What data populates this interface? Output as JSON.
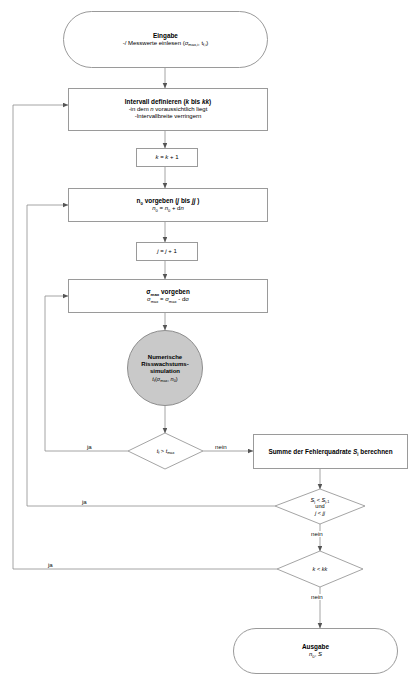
{
  "diagram": {
    "type": "flowchart",
    "language": "de",
    "nodes": [
      {
        "id": "eingabe",
        "shape": "terminator",
        "heading": "Eingabe",
        "lines": [
          "-/ Messwerte einlesen (σmax,i , tf,i)"
        ]
      },
      {
        "id": "intervall",
        "shape": "process",
        "heading": "Intervall definieren (k bis kk)",
        "lines": [
          "-in dem n voraussichtlich liegt",
          "-Intervallbreite verringern"
        ]
      },
      {
        "id": "k-inc",
        "shape": "process",
        "heading": "",
        "lines": [
          "k = k + 1"
        ]
      },
      {
        "id": "n0-vorgeben",
        "shape": "process",
        "heading": "n0 vorgeben (j bis jj )",
        "lines": [
          "n0 = n0 + dn"
        ]
      },
      {
        "id": "j-inc",
        "shape": "process",
        "heading": "",
        "lines": [
          "j = j + 1"
        ]
      },
      {
        "id": "sigma-vorgeben",
        "shape": "process",
        "heading": "σmax vorgeben",
        "lines": [
          "σmax = σmax - dσ"
        ]
      },
      {
        "id": "simulation",
        "shape": "ellipse",
        "heading": "Numerische Risswachstums- simulation",
        "lines": [
          "tf(σmax, n0)"
        ]
      },
      {
        "id": "decision-tf",
        "shape": "decision",
        "heading": "",
        "lines": [
          "tf > tmax"
        ]
      },
      {
        "id": "summe",
        "shape": "process",
        "heading": "Summe der Fehlerquadrate Sj berechnen",
        "lines": []
      },
      {
        "id": "decision-sj",
        "shape": "decision",
        "heading": "",
        "lines": [
          "Sj < Sj-1",
          "und",
          "j < jj"
        ]
      },
      {
        "id": "decision-k",
        "shape": "decision",
        "heading": "",
        "lines": [
          "k < kk"
        ]
      },
      {
        "id": "ausgabe",
        "shape": "terminator",
        "heading": "Ausgabe",
        "lines": [
          "n0, S"
        ]
      }
    ],
    "labels": {
      "eingabe_heading": "Eingabe",
      "eingabe_line1_pre": "-/ Messwerte einlesen (",
      "eingabe_line1_sig": "σ",
      "eingabe_line1_sigsub": "max,i",
      "eingabe_line1_mid": ", t",
      "eingabe_line1_tsub": "f,i",
      "eingabe_line1_post": ")",
      "intervall_heading_pre": "Intervall definieren (",
      "intervall_heading_k": "k",
      "intervall_heading_bis": " bis ",
      "intervall_heading_kk": "kk",
      "intervall_heading_post": ")",
      "intervall_line2": "-in dem ",
      "intervall_line2_n": "n",
      "intervall_line2_post": " voraussichtlich liegt",
      "intervall_line3": "-Intervallbreite verringern",
      "kinc_text_k1": "k",
      "kinc_text_eq": " = ",
      "kinc_text_k2": "k",
      "kinc_text_plus": " + 1",
      "n0_heading_n": "n",
      "n0_heading_nsub": "0",
      "n0_heading_mid": " vorgeben (",
      "n0_heading_j": "j",
      "n0_heading_bis": " bis ",
      "n0_heading_jj": "jj",
      "n0_heading_post": " )",
      "n0_line2_n": "n",
      "n0_line2_sub": "0",
      "n0_line2_eq": " = ",
      "n0_line2_n2": "n",
      "n0_line2_sub2": "0",
      "n0_line2_plus": " + d",
      "n0_line2_dn": "n",
      "jinc_text_j1": "j",
      "jinc_text_eq": " = ",
      "jinc_text_j2": "j",
      "jinc_text_plus": " + 1",
      "sigma_heading_sig": "σ",
      "sigma_heading_sub": "max",
      "sigma_heading_post": " vorgeben",
      "sigma_line2_a": "σ",
      "sigma_line2_asub": "max",
      "sigma_line2_eq": " = ",
      "sigma_line2_b": "σ",
      "sigma_line2_bsub": "max",
      "sigma_line2_minus": " - d",
      "sigma_line2_d": "σ",
      "sim_l1": "Numerische",
      "sim_l2": "Risswachstums-",
      "sim_l3": "simulation",
      "sim_l4_t": "t",
      "sim_l4_tsub": "f",
      "sim_l4_open": "(",
      "sim_l4_sig": "σ",
      "sim_l4_sigsub": "max",
      "sim_l4_comma": ", ",
      "sim_l4_n": "n",
      "sim_l4_nsub": "0",
      "sim_l4_close": ")",
      "dec_tf_t1": "t",
      "dec_tf_t1sub": "f",
      "dec_tf_gt": " > ",
      "dec_tf_t2": "t",
      "dec_tf_t2sub": "max",
      "summe_pre": "Summe der Fehlerquadrate ",
      "summe_s": "S",
      "summe_ssub": "j",
      "summe_post": " berechnen",
      "dec_sj_l1_s1": "S",
      "dec_sj_l1_s1sub": "j",
      "dec_sj_l1_lt": " < ",
      "dec_sj_l1_s2": "S",
      "dec_sj_l1_s2sub": "j-1",
      "dec_sj_l2": "und",
      "dec_sj_l3_j": "j",
      "dec_sj_l3_lt": " < ",
      "dec_sj_l3_jj": "jj",
      "dec_k_k": "k",
      "dec_k_lt": " < ",
      "dec_k_kk": "kk",
      "ausgabe_heading": "Ausgabe",
      "ausgabe_n": "n",
      "ausgabe_nsub": "0",
      "ausgabe_comma": ", ",
      "ausgabe_s": "S"
    },
    "edge_labels": {
      "ja_tf": "ja",
      "nein_tf": "nein",
      "ja_sj": "ja",
      "nein_sj": "nein",
      "ja_k": "ja",
      "nein_k": "nein"
    },
    "colors": {
      "stroke": "#9a9a9a",
      "wire": "#8d8d8d",
      "ellipse_fill": "#c9c9c9",
      "background": "#ffffff",
      "text": "#111111"
    }
  }
}
